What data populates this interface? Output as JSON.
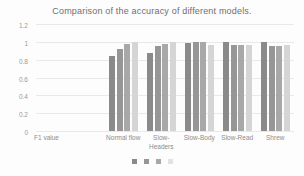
{
  "chart_data": {
    "type": "bar",
    "title": "Comparison of the accuracy of different models.",
    "xlabel": "F1 value",
    "ylabel": "",
    "ylim": [
      0,
      1.2
    ],
    "grid": true,
    "legend_position": "bottom",
    "y_ticks": [
      "1.2",
      "1",
      "0.8",
      "0.6",
      "0.4",
      "0.2",
      "0"
    ],
    "y_tick_values": [
      1.2,
      1,
      0.8,
      0.6,
      0.4,
      0.2,
      0
    ],
    "categories": [
      "Normal flow",
      "Slow-Headers",
      "Slow-Body",
      "Slow-Read",
      "Shrew"
    ],
    "series": [
      {
        "name": "Series 1",
        "color": "#8a8a8a",
        "values": [
          0.84,
          0.88,
          0.99,
          1.0,
          1.0
        ]
      },
      {
        "name": "Series 2",
        "color": "#969696",
        "values": [
          0.92,
          0.95,
          1.0,
          0.97,
          0.95
        ]
      },
      {
        "name": "Series 3",
        "color": "#a8a8a8",
        "values": [
          0.98,
          0.98,
          1.0,
          0.97,
          0.95
        ]
      },
      {
        "name": "Series 4",
        "color": "#d5d5d5",
        "values": [
          1.0,
          1.0,
          0.96,
          0.96,
          0.97
        ]
      }
    ],
    "legend": [
      {
        "label": "",
        "color": "#8a8a8a"
      },
      {
        "label": "",
        "color": "#969696"
      },
      {
        "label": "",
        "color": "#a8a8a8"
      },
      {
        "label": "",
        "color": "#e2e2e2"
      }
    ]
  }
}
